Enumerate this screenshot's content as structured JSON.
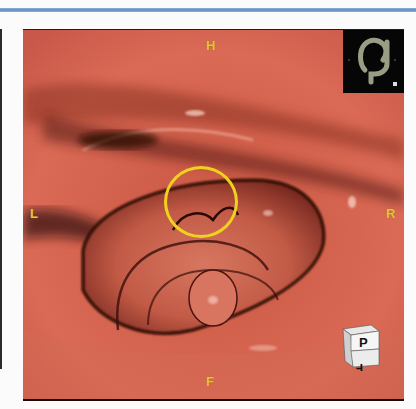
{
  "viewer": {
    "view_type": "3D virtual endoscopy (fly-through)",
    "orientation_labels": {
      "top": "H",
      "bottom": "F",
      "left": "L",
      "right": "R"
    },
    "orientation_cube": {
      "front_face": "P",
      "bottom_face": "F"
    },
    "overview_thumbnail": {
      "icon": "colon-overview-map",
      "marker": "position-marker"
    },
    "annotation": {
      "shape": "circle",
      "color": "#f0d21e"
    },
    "colors": {
      "tissue": "#d4604c",
      "shadow": "#3a1010",
      "label": "#e6c23e",
      "header_rule": "#5e8fc4"
    }
  }
}
